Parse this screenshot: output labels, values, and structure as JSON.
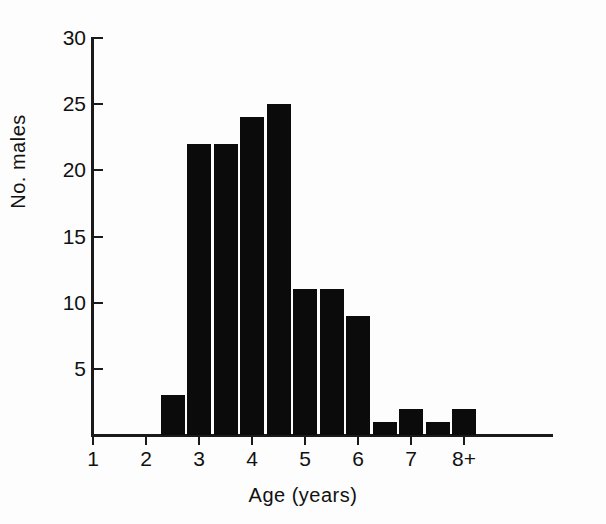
{
  "chart_data": {
    "type": "bar",
    "title": "",
    "xlabel": "Age (years)",
    "ylabel": "No. males",
    "categories": [
      "2.5",
      "3.0",
      "3.5",
      "4.0",
      "4.5",
      "5.0",
      "5.5",
      "6.0",
      "6.5",
      "7.0",
      "7.5",
      "8.0"
    ],
    "values": [
      3,
      22,
      22,
      24,
      25,
      11,
      11,
      9,
      1,
      2,
      1,
      2
    ],
    "x_tick_labels": [
      "1",
      "2",
      "3",
      "4",
      "5",
      "6",
      "7",
      "8+"
    ],
    "x_tick_values": [
      1,
      2,
      3,
      4,
      5,
      6,
      7,
      8
    ],
    "y_tick_labels": [
      "5",
      "10",
      "15",
      "20",
      "25",
      "30"
    ],
    "y_tick_values": [
      5,
      10,
      15,
      20,
      25,
      30
    ],
    "ylim": [
      0,
      30
    ],
    "xlim": [
      0.5,
      9.0
    ],
    "bin_width": 0.5,
    "grid": false,
    "legend": false,
    "bar_color": "#0b0b0b",
    "axis_color": "#1a1a1a",
    "background_color": "#fdfdfd"
  }
}
